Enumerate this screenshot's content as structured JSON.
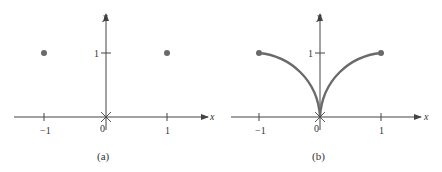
{
  "panels": [
    {
      "id": "a",
      "caption": "(a)",
      "x_axis_label": "x",
      "y_axis_label": "y",
      "x_ticks": [
        "−1",
        "0",
        "1"
      ],
      "y_ticks": [
        "1"
      ],
      "points": [
        {
          "x": -1,
          "y": 1
        },
        {
          "x": 1,
          "y": 1
        }
      ],
      "origin_marker": "cross"
    },
    {
      "id": "b",
      "caption": "(b)",
      "x_axis_label": "x",
      "y_axis_label": "y",
      "x_ticks": [
        "−1",
        "0",
        "1"
      ],
      "y_ticks": [
        "1"
      ],
      "curve": "y = sqrt(|x|) style cusp from (-1,1) to (0,0) to (1,1)",
      "endpoints": [
        {
          "x": -1,
          "y": 1
        },
        {
          "x": 1,
          "y": 1
        }
      ],
      "origin_marker": "cross"
    }
  ],
  "colors": {
    "axis": "#444444",
    "point": "#6a6a6a",
    "curve": "#6a6a6a"
  }
}
